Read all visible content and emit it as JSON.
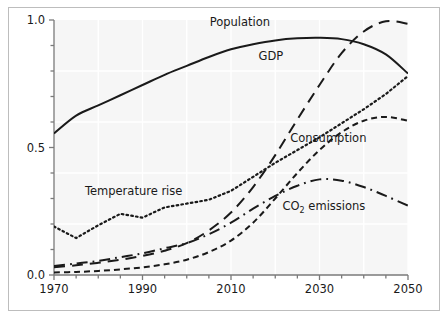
{
  "chart_data": {
    "type": "line",
    "title": "",
    "subtitle": "",
    "xlabel": "",
    "ylabel": "",
    "xlim": [
      1970,
      2050
    ],
    "ylim": [
      0.0,
      1.0
    ],
    "grid": true,
    "legend_position": "inline-annotations",
    "x_ticks": [
      1970,
      1990,
      2010,
      2030,
      2050
    ],
    "x_tick_labels": [
      "1970",
      "1990",
      "2010",
      "2030",
      "2050"
    ],
    "x_minor_tick_step": 5,
    "y_ticks": [
      0.0,
      0.5,
      1.0
    ],
    "y_tick_labels": [
      "0.0",
      "0.5",
      "1.0"
    ],
    "y_minor_tick_step": 0.1,
    "plot_background": "#f6f6f6",
    "gridline_color": "#ffffff",
    "axis_color": "#7a7a7a",
    "line_color": "#1a1a1a",
    "x": [
      1970,
      1975,
      1980,
      1985,
      1990,
      1995,
      2000,
      2005,
      2010,
      2015,
      2020,
      2025,
      2030,
      2035,
      2040,
      2045,
      2050
    ],
    "series": [
      {
        "name": "Population",
        "style": "solid",
        "color": "#1a1a1a",
        "label": "Population",
        "label_x": 2012,
        "label_y": 0.975,
        "values": [
          0.555,
          0.625,
          0.665,
          0.705,
          0.745,
          0.785,
          0.82,
          0.855,
          0.885,
          0.905,
          0.92,
          0.928,
          0.93,
          0.925,
          0.905,
          0.865,
          0.79
        ]
      },
      {
        "name": "GDP",
        "style": "long-dash",
        "color": "#1a1a1a",
        "label": "GDP",
        "label_x": 2019,
        "label_y": 0.845,
        "values": [
          0.03,
          0.038,
          0.048,
          0.06,
          0.075,
          0.095,
          0.125,
          0.175,
          0.245,
          0.345,
          0.47,
          0.61,
          0.745,
          0.87,
          0.955,
          0.995,
          0.985
        ]
      },
      {
        "name": "Temperature rise",
        "style": "dotted",
        "color": "#1a1a1a",
        "label": "Temperature rise",
        "label_x": 1988,
        "label_y": 0.315,
        "values": [
          0.19,
          0.145,
          0.195,
          0.24,
          0.225,
          0.265,
          0.28,
          0.295,
          0.33,
          0.385,
          0.44,
          0.49,
          0.54,
          0.595,
          0.65,
          0.71,
          0.78
        ]
      },
      {
        "name": "Consumption",
        "style": "short-dash",
        "color": "#1a1a1a",
        "label": "Consumption",
        "label_x": 2032,
        "label_y": 0.52,
        "values": [
          0.01,
          0.012,
          0.016,
          0.022,
          0.03,
          0.042,
          0.06,
          0.09,
          0.135,
          0.205,
          0.3,
          0.4,
          0.49,
          0.56,
          0.605,
          0.62,
          0.605
        ]
      },
      {
        "name": "CO2 emissions",
        "style": "dash-dot",
        "color": "#1a1a1a",
        "label_prefix": "CO",
        "label_sub": "2",
        "label_suffix": " emissions",
        "label": "CO2 emissions",
        "label_x": 2031,
        "label_y": 0.255,
        "values": [
          0.035,
          0.045,
          0.055,
          0.07,
          0.085,
          0.105,
          0.125,
          0.16,
          0.205,
          0.26,
          0.31,
          0.35,
          0.375,
          0.37,
          0.345,
          0.31,
          0.272
        ]
      }
    ]
  }
}
